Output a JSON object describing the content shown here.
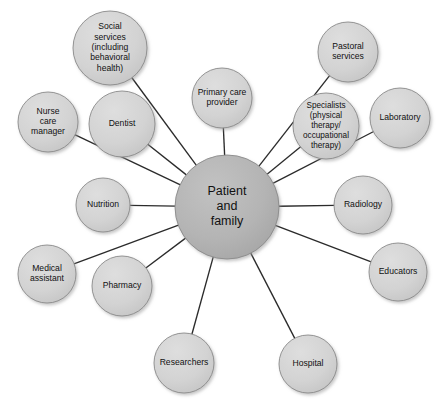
{
  "diagram": {
    "type": "hub-and-spoke-network",
    "canvas": {
      "width": 447,
      "height": 409,
      "background": "#ffffff"
    },
    "colors": {
      "center_fill": "#b2b2b2",
      "satellite_fill": "#d2d2d2",
      "node_stroke": "#8a8a8a",
      "edge_stroke": "#2b2b2b",
      "label_text": "#111111",
      "shadow": "#b9b9b9"
    },
    "center": {
      "id": "patient-and-family",
      "label": "Patient and family",
      "lines": [
        "Patient",
        "and",
        "family"
      ],
      "cx": 227,
      "cy": 207,
      "r": 52,
      "font_size": 12.5
    },
    "satellites": [
      {
        "id": "social-services",
        "label": "Social services (including behavioral health)",
        "lines": [
          "Social",
          "services",
          "(including",
          "behavioral",
          "health)"
        ],
        "cx": 110,
        "cy": 48,
        "r": 37,
        "font_size": 8.6
      },
      {
        "id": "primary-care-provider",
        "label": "Primary care provider",
        "lines": [
          "Primary care",
          "provider"
        ],
        "cx": 222,
        "cy": 98,
        "r": 30,
        "font_size": 8.6
      },
      {
        "id": "pastoral-services",
        "label": "Pastoral services",
        "lines": [
          "Pastoral",
          "services"
        ],
        "cx": 348,
        "cy": 52,
        "r": 30,
        "font_size": 8.6
      },
      {
        "id": "specialists",
        "label": "Specialists (physical therapy/ occupational therapy)",
        "lines": [
          "Specialists",
          "(physical",
          "therapy/",
          "occupational",
          "therapy)"
        ],
        "cx": 326,
        "cy": 126,
        "r": 33,
        "font_size": 8.2
      },
      {
        "id": "laboratory",
        "label": "Laboratory",
        "lines": [
          "Laboratory"
        ],
        "cx": 400,
        "cy": 118,
        "r": 30,
        "font_size": 8.6
      },
      {
        "id": "radiology",
        "label": "Radiology",
        "lines": [
          "Radiology"
        ],
        "cx": 363,
        "cy": 205,
        "r": 29,
        "font_size": 8.6
      },
      {
        "id": "educators",
        "label": "Educators",
        "lines": [
          "Educators"
        ],
        "cx": 398,
        "cy": 272,
        "r": 29,
        "font_size": 8.6
      },
      {
        "id": "hospital",
        "label": "Hospital",
        "lines": [
          "Hospital"
        ],
        "cx": 308,
        "cy": 364,
        "r": 29,
        "font_size": 8.6
      },
      {
        "id": "researchers",
        "label": "Researchers",
        "lines": [
          "Researchers"
        ],
        "cx": 184,
        "cy": 363,
        "r": 30,
        "font_size": 8.6
      },
      {
        "id": "pharmacy",
        "label": "Pharmacy",
        "lines": [
          "Pharmacy"
        ],
        "cx": 122,
        "cy": 286,
        "r": 30,
        "font_size": 8.6
      },
      {
        "id": "medical-assistant",
        "label": "Medical assistant",
        "lines": [
          "Medical",
          "assistant"
        ],
        "cx": 47,
        "cy": 274,
        "r": 29,
        "font_size": 8.6
      },
      {
        "id": "nutrition",
        "label": "Nutrition",
        "lines": [
          "Nutrition"
        ],
        "cx": 103,
        "cy": 205,
        "r": 27,
        "font_size": 8.6
      },
      {
        "id": "nurse-care-manager",
        "label": "Nurse care manager",
        "lines": [
          "Nurse",
          "care",
          "manager"
        ],
        "cx": 48,
        "cy": 122,
        "r": 30,
        "font_size": 8.6
      },
      {
        "id": "dentist",
        "label": "Dentist",
        "lines": [
          "Dentist"
        ],
        "cx": 122,
        "cy": 124,
        "r": 33,
        "font_size": 8.6
      }
    ],
    "edges": [
      {
        "from": "patient-and-family",
        "to": "social-services"
      },
      {
        "from": "patient-and-family",
        "to": "primary-care-provider"
      },
      {
        "from": "patient-and-family",
        "to": "pastoral-services"
      },
      {
        "from": "patient-and-family",
        "to": "specialists"
      },
      {
        "from": "patient-and-family",
        "to": "laboratory"
      },
      {
        "from": "patient-and-family",
        "to": "radiology"
      },
      {
        "from": "patient-and-family",
        "to": "educators"
      },
      {
        "from": "patient-and-family",
        "to": "hospital"
      },
      {
        "from": "patient-and-family",
        "to": "researchers"
      },
      {
        "from": "patient-and-family",
        "to": "pharmacy"
      },
      {
        "from": "patient-and-family",
        "to": "medical-assistant"
      },
      {
        "from": "patient-and-family",
        "to": "nutrition"
      },
      {
        "from": "patient-and-family",
        "to": "nurse-care-manager"
      },
      {
        "from": "patient-and-family",
        "to": "dentist"
      }
    ]
  }
}
